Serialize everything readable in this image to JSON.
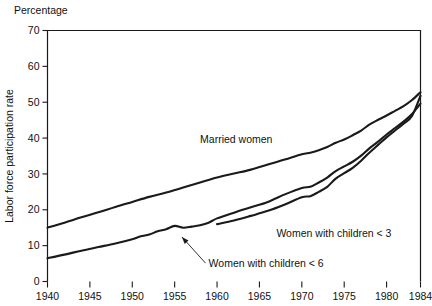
{
  "chart_data": {
    "type": "line",
    "title": "",
    "top_label": "Percentage",
    "ylabel": "Labor force participation rate",
    "xlabel": "",
    "ylim": [
      0,
      70
    ],
    "xlim": [
      1940,
      1984
    ],
    "grid": false,
    "legend_position": "inline-annotations",
    "yticks": [
      0,
      10,
      20,
      30,
      40,
      50,
      60,
      70
    ],
    "ytick_labels": [
      "0",
      "10",
      "20",
      "30",
      "40",
      "50",
      "60",
      "70"
    ],
    "xticks": [
      1940,
      1945,
      1950,
      1955,
      1960,
      1965,
      1970,
      1975,
      1980,
      1984
    ],
    "xtick_labels": [
      "1940",
      "1945",
      "1950",
      "1955",
      "1960",
      "1965",
      "1970",
      "1975",
      "1980",
      "1984"
    ],
    "series": [
      {
        "name": "Married women",
        "label": "Married women",
        "label_x": 1958,
        "label_y": 38.5,
        "x": [
          1940,
          1942,
          1944,
          1946,
          1948,
          1950,
          1952,
          1954,
          1956,
          1958,
          1960,
          1962,
          1964,
          1966,
          1968,
          1970,
          1971,
          1972,
          1973,
          1974,
          1975,
          1976,
          1977,
          1978,
          1979,
          1980,
          1981,
          1982,
          1983,
          1984
        ],
        "values": [
          15.0,
          16.4,
          17.9,
          19.3,
          20.8,
          22.2,
          23.6,
          24.8,
          26.2,
          27.6,
          29.0,
          30.1,
          31.2,
          32.6,
          34.0,
          35.5,
          35.9,
          36.6,
          37.5,
          38.7,
          39.6,
          40.8,
          42.1,
          43.8,
          45.1,
          46.3,
          47.6,
          48.9,
          50.6,
          52.8
        ]
      },
      {
        "name": "Women with children < 6",
        "label": "Women with children < 6",
        "label_x": 1959,
        "label_y": 4.0,
        "x": [
          1940,
          1942,
          1944,
          1946,
          1948,
          1950,
          1951,
          1952,
          1953,
          1954,
          1955,
          1956,
          1957,
          1958,
          1959,
          1960,
          1962,
          1964,
          1966,
          1968,
          1970,
          1971,
          1972,
          1973,
          1974,
          1975,
          1976,
          1977,
          1978,
          1979,
          1980,
          1981,
          1982,
          1983,
          1984
        ],
        "values": [
          6.5,
          7.5,
          8.6,
          9.6,
          10.6,
          11.8,
          12.6,
          13.1,
          14.0,
          14.6,
          15.5,
          15.0,
          15.3,
          15.7,
          16.4,
          17.6,
          19.2,
          20.7,
          22.2,
          24.3,
          26.1,
          26.4,
          27.6,
          29.0,
          30.8,
          32.1,
          33.4,
          35.1,
          37.2,
          39.0,
          41.0,
          42.8,
          44.6,
          46.7,
          49.6
        ]
      },
      {
        "name": "Women with children < 3",
        "label": "Women with children < 3",
        "label_x": 1967,
        "label_y": 12.5,
        "x": [
          1960,
          1962,
          1964,
          1966,
          1968,
          1970,
          1971,
          1972,
          1973,
          1974,
          1975,
          1976,
          1977,
          1978,
          1979,
          1980,
          1981,
          1982,
          1983,
          1984
        ],
        "values": [
          16.0,
          17.0,
          18.3,
          19.7,
          21.5,
          23.5,
          23.8,
          25.0,
          26.4,
          28.7,
          30.2,
          31.7,
          33.7,
          36.0,
          38.1,
          40.2,
          42.1,
          44.0,
          46.2,
          51.8
        ]
      }
    ],
    "annotations": [
      {
        "name": "children-under-6-leader",
        "text_x": 1959,
        "text_y": 4.0,
        "point_x": 1955.5,
        "point_y": 14.1
      }
    ]
  }
}
